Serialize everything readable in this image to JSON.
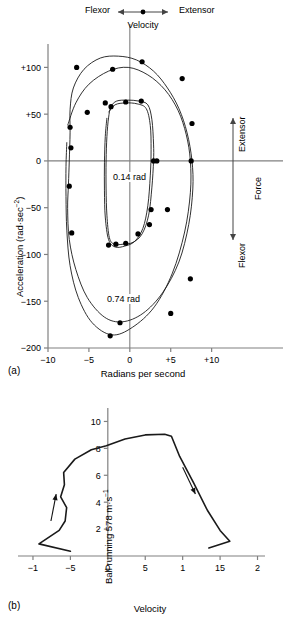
{
  "figure": {
    "panel_a_tag": "(a)",
    "panel_b_tag": "(b)"
  },
  "panel_a": {
    "top_left_label": "Flexor",
    "top_right_label": "Extensor",
    "top_axis_label": "Velocity",
    "right_top_label": "Extensor",
    "right_bottom_label": "Flexor",
    "right_axis_label": "Force",
    "y_axis_title_main": "Acceleration (rad·sec",
    "y_axis_title_exp": "−2",
    "y_axis_title_close": ")",
    "x_axis_title": "Radians per second",
    "annotation_inner": "0.14 rad",
    "annotation_outer": "0.74 rad",
    "y_ticks": [
      "+100",
      "+50",
      "0",
      "−50",
      "−100",
      "−150",
      "−200"
    ],
    "x_ticks": [
      "−10",
      "−5",
      "0",
      "+5",
      "+10"
    ]
  },
  "panel_b": {
    "x_axis_title": "Velocity",
    "curve_label": "Ball running 578 m·s",
    "curve_label_exp": "−1",
    "y_ticks": [
      "10",
      "8",
      "6",
      "4",
      "2"
    ],
    "x_ticks": [
      "−1",
      "−5",
      "0",
      "5",
      "1",
      "15",
      "2"
    ]
  },
  "chart_data": [
    {
      "type": "line",
      "title": "(a) Acceleration vs angular velocity phase-plane loops",
      "xlabel": "Radians per second",
      "ylabel": "Acceleration (rad·sec−2)",
      "xlim": [
        -10,
        12
      ],
      "ylim": [
        -200,
        125
      ],
      "xticks": [
        -10,
        -5,
        0,
        5,
        10
      ],
      "xticklabels": [
        "−10",
        "−5",
        "0",
        "+5",
        "+10"
      ],
      "yticks": [
        100,
        50,
        0,
        -50,
        -100,
        -150,
        -200
      ],
      "yticklabels": [
        "+100",
        "+50",
        "0",
        "−50",
        "−100",
        "−150",
        "−200"
      ],
      "grid": false,
      "legend": null,
      "annotations": [
        {
          "text": "0.14 rad",
          "x": 0.4,
          "y": -18
        },
        {
          "text": "0.74 rad",
          "x": -0.5,
          "y": -153
        },
        {
          "text": "Flexor",
          "x": -5.5,
          "y": 124
        },
        {
          "text": "Extensor",
          "x": 5.5,
          "y": 124
        },
        {
          "text": "Velocity",
          "x": 0,
          "y": 112
        },
        {
          "text": "Extensor",
          "x": 11.2,
          "y": 60
        },
        {
          "text": "Force",
          "x": 12.2,
          "y": 0
        },
        {
          "text": "Flexor",
          "x": 11.2,
          "y": -62
        }
      ],
      "series": [
        {
          "name": "0.74 rad loop (outer)",
          "closed": true,
          "points": [
            [
              -7.3,
              55
            ],
            [
              -6.9,
              78
            ],
            [
              -5.6,
              98
            ],
            [
              -3.6,
              110
            ],
            [
              -1.4,
              112
            ],
            [
              0.8,
              108
            ],
            [
              2.9,
              96
            ],
            [
              4.6,
              78
            ],
            [
              6.0,
              56
            ],
            [
              7.0,
              30
            ],
            [
              7.6,
              0
            ],
            [
              7.7,
              -30
            ],
            [
              7.2,
              -68
            ],
            [
              6.0,
              -108
            ],
            [
              4.0,
              -141
            ],
            [
              1.6,
              -163
            ],
            [
              -0.9,
              -172
            ],
            [
              -3.1,
              -167
            ],
            [
              -5.2,
              -146
            ],
            [
              -6.6,
              -116
            ],
            [
              -7.4,
              -84
            ],
            [
              -7.6,
              -51
            ],
            [
              -7.5,
              -25
            ],
            [
              -7.4,
              0
            ],
            [
              -7.3,
              30
            ]
          ]
        },
        {
          "name": "0.74 rad loop (return arc)",
          "closed": false,
          "points": [
            [
              -7.6,
              38
            ],
            [
              -6.6,
              62
            ],
            [
              -5.0,
              82
            ],
            [
              -2.6,
              96
            ],
            [
              -0.2,
              100
            ],
            [
              2.2,
              92
            ],
            [
              4.3,
              76
            ],
            [
              5.9,
              54
            ],
            [
              6.9,
              28
            ],
            [
              7.4,
              0
            ],
            [
              7.4,
              -34
            ],
            [
              6.7,
              -76
            ],
            [
              5.2,
              -120
            ],
            [
              3.0,
              -156
            ],
            [
              0.3,
              -178
            ],
            [
              -2.2,
              -186
            ],
            [
              -4.6,
              -173
            ],
            [
              -6.3,
              -146
            ],
            [
              -7.3,
              -112
            ],
            [
              -7.7,
              -74
            ],
            [
              -7.8,
              -38
            ],
            [
              -7.8,
              -6
            ],
            [
              -7.7,
              20
            ]
          ]
        },
        {
          "name": "0.14 rad loop (inner)",
          "closed": true,
          "points": [
            [
              -2.3,
              58
            ],
            [
              -1.6,
              64
            ],
            [
              -0.3,
              65
            ],
            [
              1.1,
              64
            ],
            [
              2.2,
              60
            ],
            [
              2.7,
              44
            ],
            [
              2.9,
              18
            ],
            [
              2.9,
              0
            ],
            [
              2.7,
              -28
            ],
            [
              2.3,
              -58
            ],
            [
              1.5,
              -78
            ],
            [
              0.4,
              -87
            ],
            [
              -0.8,
              -89
            ],
            [
              -1.9,
              -89
            ],
            [
              -2.5,
              -82
            ],
            [
              -2.8,
              -58
            ],
            [
              -2.9,
              -30
            ],
            [
              -2.9,
              0
            ],
            [
              -2.8,
              26
            ],
            [
              -2.6,
              46
            ]
          ]
        },
        {
          "name": "0.14 rad loop (return arc)",
          "closed": false,
          "points": [
            [
              -2.6,
              52
            ],
            [
              -1.8,
              60
            ],
            [
              -0.5,
              62
            ],
            [
              0.9,
              61
            ],
            [
              2.0,
              56
            ],
            [
              2.5,
              38
            ],
            [
              2.6,
              12
            ],
            [
              2.5,
              -16
            ],
            [
              2.2,
              -48
            ],
            [
              1.6,
              -72
            ],
            [
              0.6,
              -86
            ],
            [
              -0.6,
              -91
            ],
            [
              -1.8,
              -92
            ],
            [
              -2.6,
              -84
            ],
            [
              -3.0,
              -60
            ],
            [
              -3.1,
              -32
            ],
            [
              -3.1,
              -2
            ],
            [
              -3.0,
              26
            ],
            [
              -2.8,
              46
            ]
          ]
        }
      ],
      "markers": [
        [
          -7.3,
          36
        ],
        [
          -7.2,
          14
        ],
        [
          -7.4,
          -27
        ],
        [
          -7.1,
          -77
        ],
        [
          -6.5,
          100
        ],
        [
          -5.2,
          52
        ],
        [
          -3.0,
          62
        ],
        [
          -2.1,
          98
        ],
        [
          1.5,
          106
        ],
        [
          3.3,
          0
        ],
        [
          4.6,
          -52
        ],
        [
          6.4,
          88
        ],
        [
          7.6,
          40
        ],
        [
          7.5,
          0
        ],
        [
          7.4,
          -126
        ],
        [
          5.0,
          -163
        ],
        [
          -1.2,
          -173
        ],
        [
          -2.4,
          -187
        ],
        [
          -2.3,
          58
        ],
        [
          -0.5,
          63
        ],
        [
          1.4,
          64
        ],
        [
          2.9,
          0
        ],
        [
          2.4,
          -68
        ],
        [
          1.0,
          -78
        ],
        [
          -0.5,
          -88
        ],
        [
          -1.7,
          -89
        ],
        [
          -2.6,
          -90
        ],
        [
          2.6,
          -52
        ]
      ]
    },
    {
      "type": "line",
      "title": "(b) Ball running velocity profile",
      "xlabel": "Velocity",
      "ylabel": "",
      "xlim": [
        -12,
        21
      ],
      "ylim": [
        0,
        11
      ],
      "xticks": [
        -10,
        -5,
        0,
        5,
        10,
        15,
        20
      ],
      "xticklabels": [
        "−1",
        "−5",
        "0",
        "5",
        "1",
        "15",
        "2"
      ],
      "yticks": [
        2,
        4,
        6,
        8,
        10
      ],
      "yticklabels": [
        "2",
        "4",
        "6",
        "8",
        "10"
      ],
      "grid": false,
      "annotations": [
        {
          "text": "Ball running 578 m·s−1",
          "x": 1.0,
          "y": 4.5
        }
      ],
      "series": [
        {
          "name": "velocity profile",
          "closed": false,
          "points": [
            [
              -5.0,
              0.35
            ],
            [
              -9.2,
              0.9
            ],
            [
              -6.5,
              1.9
            ],
            [
              -5.7,
              2.6
            ],
            [
              -5.5,
              3.6
            ],
            [
              -6.3,
              4.4
            ],
            [
              -5.8,
              5.3
            ],
            [
              -5.9,
              6.2
            ],
            [
              -4.4,
              7.2
            ],
            [
              -2.2,
              7.9
            ],
            [
              -0.2,
              8.2
            ],
            [
              2.3,
              8.7
            ],
            [
              5.0,
              9.0
            ],
            [
              7.6,
              9.05
            ],
            [
              8.5,
              8.9
            ],
            [
              9.6,
              7.4
            ],
            [
              11.5,
              5.4
            ],
            [
              13.3,
              3.4
            ],
            [
              15.0,
              1.9
            ],
            [
              16.3,
              1.1
            ],
            [
              13.5,
              0.6
            ]
          ]
        }
      ],
      "direction_arrows": [
        {
          "from": [
            -7.6,
            2.6
          ],
          "to": [
            -6.9,
            4.6
          ]
        },
        {
          "from": [
            10.0,
            6.6
          ],
          "to": [
            11.7,
            4.6
          ]
        }
      ]
    }
  ]
}
